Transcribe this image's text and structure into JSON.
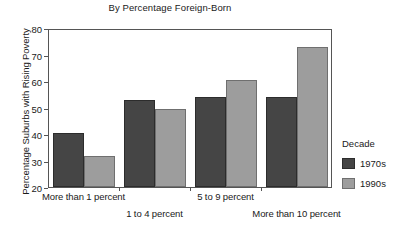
{
  "chart_data": {
    "type": "bar",
    "title": "By Percentage Foreign-Born",
    "xlabel": "",
    "ylabel": "Percentage Suburbs with Rising Poverty",
    "ylim": [
      20,
      80
    ],
    "yticks": [
      20,
      30,
      40,
      50,
      60,
      70,
      80
    ],
    "grid": false,
    "legend_position": "right",
    "legend_title": "Decade",
    "categories": [
      "More than 1 percent",
      "1 to 4 percent",
      "5 to 9 percent",
      "More than 10 percent"
    ],
    "series": [
      {
        "name": "1970s",
        "color": "#454545",
        "values": [
          40.5,
          53.0,
          54.0,
          54.0
        ]
      },
      {
        "name": "1990s",
        "color": "#9d9d9d",
        "values": [
          31.8,
          49.3,
          60.3,
          73.0
        ]
      }
    ]
  },
  "axis": {
    "frame_color": "#555555"
  }
}
